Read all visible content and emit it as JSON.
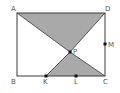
{
  "diagram": {
    "type": "geometry-rectangle",
    "colors": {
      "stroke": "#3a3a3a",
      "shade": "#a9a9a9",
      "point": "#111111",
      "label": "#555555"
    },
    "points": {
      "A": {
        "label": "A",
        "x": 17,
        "y": 13
      },
      "D": {
        "label": "D",
        "x": 105,
        "y": 13
      },
      "B": {
        "label": "B",
        "x": 17,
        "y": 76
      },
      "C": {
        "label": "C",
        "x": 105,
        "y": 76
      },
      "P": {
        "label": "P",
        "x": 70,
        "y": 52
      },
      "M": {
        "label": "M",
        "x": 105,
        "y": 44
      },
      "K": {
        "label": "K",
        "x": 46,
        "y": 76
      },
      "L": {
        "label": "L",
        "x": 76,
        "y": 76
      }
    },
    "shaded_regions": [
      {
        "name": "triangle-ADP",
        "vertices": [
          "A",
          "D",
          "P"
        ]
      },
      {
        "name": "triangle-KPC",
        "vertices": [
          "K",
          "P",
          "C"
        ]
      }
    ],
    "segments": [
      [
        "A",
        "D"
      ],
      [
        "D",
        "C"
      ],
      [
        "C",
        "B"
      ],
      [
        "B",
        "A"
      ],
      [
        "A",
        "P"
      ],
      [
        "P",
        "C"
      ],
      [
        "D",
        "P"
      ],
      [
        "P",
        "K"
      ]
    ]
  }
}
